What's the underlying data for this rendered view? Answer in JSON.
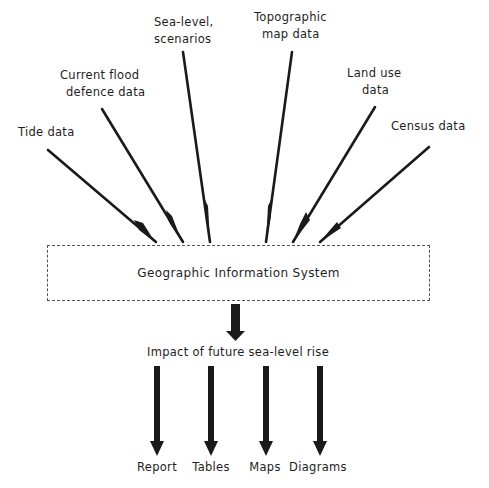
{
  "diagram": {
    "inputs": [
      {
        "id": "tide",
        "lines": [
          "Tide data"
        ]
      },
      {
        "id": "flood-defence",
        "lines": [
          "Current flood",
          "defence data"
        ]
      },
      {
        "id": "sea-level",
        "lines": [
          "Sea-level,",
          "scenarios"
        ]
      },
      {
        "id": "topographic",
        "lines": [
          "Topographic",
          "map data"
        ]
      },
      {
        "id": "land-use",
        "lines": [
          "Land use",
          "data"
        ]
      },
      {
        "id": "census",
        "lines": [
          "Census data"
        ]
      }
    ],
    "system": {
      "label": "Geographic Information System"
    },
    "impact": {
      "label": "Impact of future sea-level rise"
    },
    "outputs": [
      {
        "id": "report",
        "label": "Report"
      },
      {
        "id": "tables",
        "label": "Tables"
      },
      {
        "id": "maps",
        "label": "Maps"
      },
      {
        "id": "diagrams",
        "label": "Diagrams"
      }
    ]
  }
}
